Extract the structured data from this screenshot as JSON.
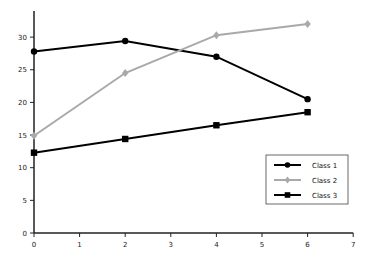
{
  "chart_data": {
    "type": "line",
    "title": "",
    "xlabel": "",
    "ylabel": "",
    "x": [
      0,
      2,
      4,
      6
    ],
    "xlim": [
      0,
      7
    ],
    "ylim": [
      0,
      34
    ],
    "x_ticks": [
      0,
      1,
      2,
      3,
      4,
      5,
      6,
      7
    ],
    "y_ticks": [
      0,
      5,
      10,
      15,
      20,
      25,
      30
    ],
    "grid": false,
    "legend_position": "lower right",
    "series": [
      {
        "name": "Class 1",
        "values": [
          27.8,
          29.4,
          27.0,
          20.5
        ],
        "color": "#000000",
        "marker": "circle"
      },
      {
        "name": "Class 2",
        "values": [
          14.9,
          24.5,
          30.3,
          32.0
        ],
        "color": "#a9a9a9",
        "marker": "diamond"
      },
      {
        "name": "Class 3",
        "values": [
          12.3,
          14.4,
          16.5,
          18.5
        ],
        "color": "#000000",
        "marker": "square"
      }
    ]
  }
}
